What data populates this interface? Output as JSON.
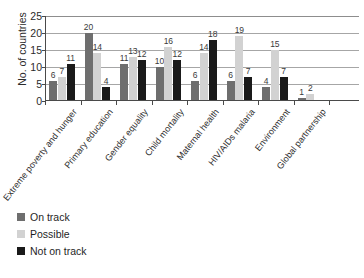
{
  "chart_data": {
    "type": "bar",
    "title": "",
    "xlabel": "",
    "ylabel": "No. of countries",
    "ylim": [
      0,
      25
    ],
    "yticks": [
      0,
      5,
      10,
      15,
      20,
      25
    ],
    "grid": true,
    "legend_position": "bottom-left",
    "categories": [
      "Extreme poverty and hunger",
      "Primary education",
      "Gender equality",
      "Child mortality",
      "Maternal health",
      "HIV/AIDs malaria",
      "Environment",
      "Global partnership"
    ],
    "series": [
      {
        "name": "On track",
        "color": "#6e6e6e",
        "values": [
          6,
          20,
          11,
          10,
          6,
          6,
          4,
          1
        ]
      },
      {
        "name": "Possible",
        "color": "#d2d2d2",
        "values": [
          7,
          14,
          13,
          16,
          14,
          19,
          15,
          2
        ]
      },
      {
        "name": "Not on track",
        "color": "#1a1a1a",
        "values": [
          11,
          4,
          12,
          12,
          18,
          7,
          7,
          null
        ]
      }
    ]
  },
  "axis": {
    "y_title": "No. of countries",
    "y_tick_labels": [
      "25",
      "20",
      "15",
      "10",
      "5",
      "0"
    ]
  },
  "legend": {
    "items": [
      {
        "label": "On track",
        "color": "#6e6e6e"
      },
      {
        "label": "Possible",
        "color": "#d2d2d2"
      },
      {
        "label": "Not on track",
        "color": "#1a1a1a"
      }
    ]
  }
}
